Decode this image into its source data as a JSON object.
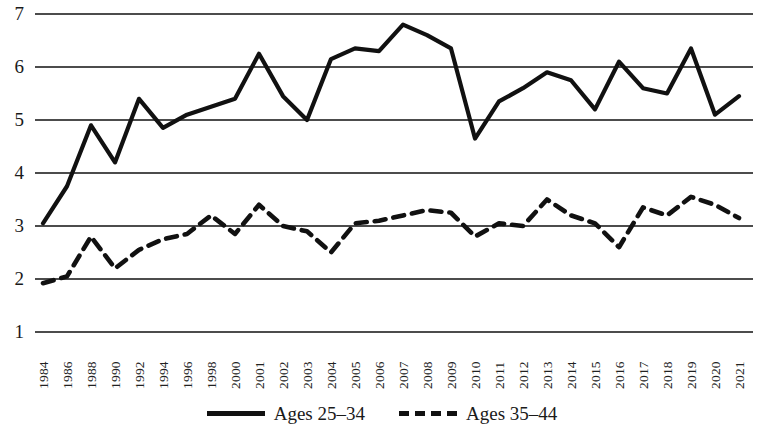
{
  "chart_data": {
    "type": "line",
    "title": "",
    "subtitle": "",
    "xlabel": "",
    "ylabel": "",
    "ylim": [
      1,
      7
    ],
    "y_ticks": [
      1,
      2,
      3,
      4,
      5,
      6,
      7
    ],
    "grid": "horizontal",
    "legend_position": "bottom-center",
    "x": [
      "1984",
      "1986",
      "1988",
      "1990",
      "1992",
      "1994",
      "1996",
      "1998",
      "2000",
      "2001",
      "2002",
      "2003",
      "2004",
      "2005",
      "2006",
      "2007",
      "2008",
      "2009",
      "2010",
      "2011",
      "2012",
      "2013",
      "2014",
      "2015",
      "2016",
      "2017",
      "2018",
      "2019",
      "2020",
      "2021"
    ],
    "x_tick_labels": [
      "1984",
      "1986",
      "1988",
      "1990",
      "1992",
      "1994",
      "1996",
      "1998",
      "2000",
      "2001",
      "2002",
      "2003",
      "2004",
      "2005",
      "2006",
      "2007",
      "2008",
      "2009",
      "2010",
      "2011",
      "2012",
      "2013",
      "2014",
      "2015",
      "2016",
      "2017",
      "2018",
      "2019",
      "2020",
      "2021"
    ],
    "series": [
      {
        "name": "Ages 25–34",
        "style": "solid",
        "color": "#111111",
        "values": [
          3.05,
          3.75,
          4.9,
          4.2,
          5.4,
          4.85,
          5.1,
          5.25,
          5.4,
          6.25,
          5.45,
          5.0,
          6.15,
          6.35,
          6.3,
          6.8,
          6.6,
          6.35,
          4.65,
          5.35,
          5.6,
          5.9,
          5.75,
          5.2,
          6.1,
          5.6,
          5.5,
          6.35,
          5.1,
          5.45
        ]
      },
      {
        "name": "Ages 35–44",
        "style": "dashed",
        "color": "#111111",
        "values": [
          1.92,
          2.05,
          2.8,
          2.2,
          2.55,
          2.75,
          2.85,
          3.2,
          2.85,
          3.4,
          3.0,
          2.9,
          2.5,
          3.05,
          3.1,
          3.2,
          3.3,
          3.25,
          2.8,
          3.05,
          3.0,
          3.5,
          3.2,
          3.05,
          2.6,
          3.35,
          3.2,
          3.55,
          3.4,
          3.15
        ]
      }
    ]
  },
  "legend": {
    "entries": [
      {
        "label": "Ages 25–34",
        "style": "solid"
      },
      {
        "label": "Ages 35–44",
        "style": "dashed"
      }
    ]
  }
}
